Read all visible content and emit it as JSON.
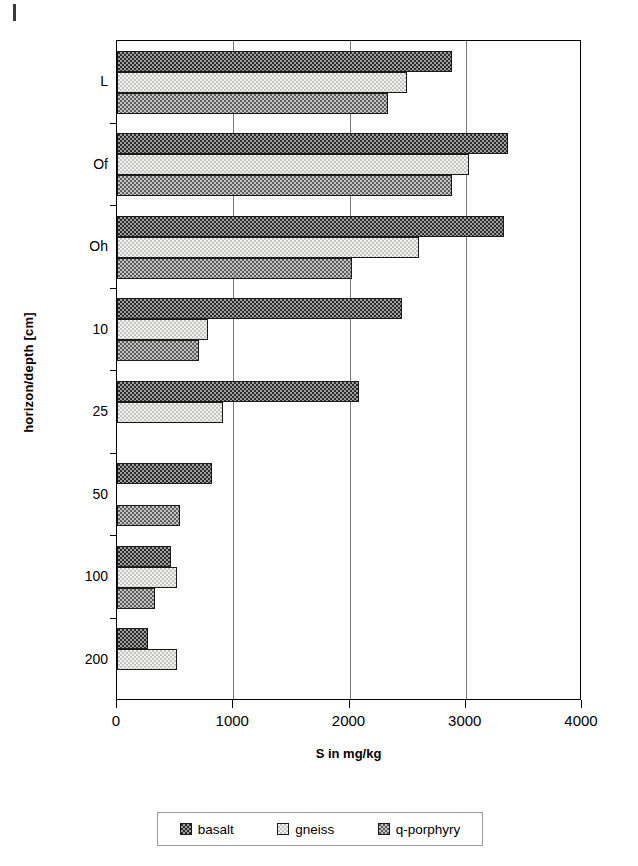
{
  "chart_data": {
    "type": "bar",
    "orientation": "horizontal",
    "title": "",
    "xlabel": "S in mg/kg",
    "ylabel": "horizon/depth [cm]",
    "categories": [
      "L",
      "Of",
      "Oh",
      "10",
      "25",
      "50",
      "100",
      "200"
    ],
    "xlim": [
      0,
      4000
    ],
    "xticks": [
      "0",
      "1000",
      "2000",
      "3000",
      "4000"
    ],
    "grid": "vertical gridlines at 1000, 2000, 3000",
    "legend_position": "bottom",
    "series": [
      {
        "name": "basalt",
        "pattern": "dark-checkered",
        "color": "#2b2b2b",
        "values": [
          2880,
          3360,
          3330,
          2450,
          2080,
          815,
          465,
          265
        ]
      },
      {
        "name": "gneiss",
        "pattern": "light-dotted",
        "color": "#f2f2f0",
        "values": [
          2495,
          3030,
          2600,
          785,
          915,
          null,
          520,
          520
        ]
      },
      {
        "name": "q-porphyry",
        "pattern": "medium-checkered",
        "color": "#5e5e5e",
        "values": [
          2335,
          2880,
          2020,
          705,
          null,
          540,
          330,
          null
        ]
      }
    ]
  },
  "axes": {
    "y_title": "horizon/depth [cm]",
    "x_title": "S in mg/kg",
    "y_categories": [
      "L",
      "Of",
      "Oh",
      "10",
      "25",
      "50",
      "100",
      "200"
    ],
    "x_tick_labels": [
      "0",
      "1000",
      "2000",
      "3000",
      "4000"
    ]
  },
  "legend": {
    "items": [
      {
        "label": "basalt",
        "swatch": "dark-checkered-swatch"
      },
      {
        "label": "gneiss",
        "swatch": "light-dotted-swatch"
      },
      {
        "label": "q-porphyry",
        "swatch": "medium-checkered-swatch"
      }
    ]
  }
}
